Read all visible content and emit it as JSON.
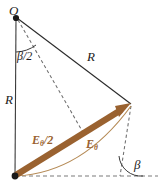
{
  "figure": {
    "width": 158,
    "height": 190,
    "colors": {
      "line": "#2a2a2a",
      "dashed": "#6b6b6b",
      "arrow": "#9a6230",
      "arc_thin": "#b08a58",
      "background": "#ffffff"
    },
    "points": {
      "O": {
        "x": 16,
        "y": 17,
        "label": "O"
      },
      "bottom_left": {
        "x": 15,
        "y": 176
      },
      "right_vertex": {
        "x": 131,
        "y": 104
      },
      "arrow_midpoint": {
        "x": 83,
        "y": 133
      }
    },
    "labels": {
      "origin": "O",
      "radius_left": "R",
      "radius_right": "R",
      "half_angle": "β/2",
      "angle": "β",
      "field_half_base": "E",
      "field_half_sub": "θ",
      "field_half_suffix": "/2",
      "field_base": "E",
      "field_sub": "θ"
    },
    "elements": [
      {
        "name": "vertical-radius-line",
        "from": "O",
        "to": "bottom_left",
        "style": "solid",
        "label": "R"
      },
      {
        "name": "slanted-radius-line",
        "from": "O",
        "to": "right_vertex",
        "style": "solid",
        "label": "R"
      },
      {
        "name": "bisector-dashed-line",
        "from": "O",
        "to": "arrow_midpoint",
        "style": "dashed"
      },
      {
        "name": "vertex-dashed-line",
        "from": "right_vertex",
        "to": "beta_vertex",
        "style": "dashed"
      },
      {
        "name": "horizontal-dashed-baseline",
        "from": "bottom_left",
        "to": "right_edge",
        "style": "dashed"
      },
      {
        "name": "resultant-field-arrow",
        "from": "bottom_left",
        "to": "right_vertex",
        "style": "thick-arrow",
        "label": "Eθ/2"
      },
      {
        "name": "arc-phasor-curve",
        "from": "bottom_left",
        "to": "right_vertex",
        "style": "curve",
        "label": "Eθ"
      },
      {
        "name": "half-angle-arc",
        "at": "O",
        "label": "β/2"
      },
      {
        "name": "beta-angle-arc",
        "at": "beta_vertex",
        "label": "β"
      }
    ]
  }
}
